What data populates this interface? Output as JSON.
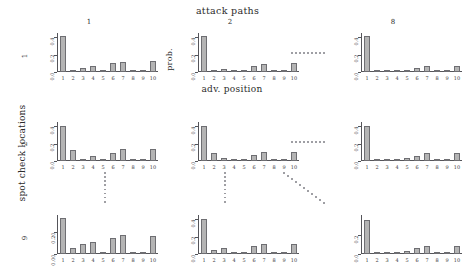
{
  "figure": {
    "top_title": "attack paths",
    "left_title": "spot check locations",
    "x_axis_label": "adv. position",
    "y_axis_label": "prob.",
    "column_labels": [
      "1",
      "2",
      "8"
    ],
    "row_labels": [
      "1",
      "2",
      "9"
    ],
    "bar_fill_color": "#b4b4b4",
    "bar_border_color": "#6e6e72",
    "axis_color": "#55555a",
    "background_color": "#ffffff"
  },
  "chart_data": {
    "type": "bar",
    "title": "attack paths",
    "xlabel": "adv. position",
    "ylabel": "prob.",
    "grid": false,
    "legend": "none",
    "layout": {
      "rows": 3,
      "cols": 3,
      "row_variable": "spot check locations",
      "col_variable": "attack paths",
      "row_levels": [
        "1",
        "2",
        "9"
      ],
      "col_levels": [
        "1",
        "2",
        "8"
      ],
      "row_gap_indicator": "vertical dotted ellipsis",
      "col_gap_indicator": "horizontal dotted ellipsis",
      "corner_gap_indicator": "diagonal dotted ellipsis"
    },
    "categories": [
      "1",
      "2",
      "3",
      "4",
      "5",
      "6",
      "7",
      "8",
      "9",
      "10"
    ],
    "panels": [
      {
        "row": "1",
        "col": "1",
        "ylim": [
          0.0,
          0.45
        ],
        "yticks": [
          0.0,
          0.2,
          0.4
        ],
        "ytick_labels": [
          "0.0",
          "0.2",
          "0.4"
        ],
        "values": [
          0.41,
          0.02,
          0.05,
          0.07,
          0.005,
          0.1,
          0.12,
          0.004,
          0.004,
          0.13
        ]
      },
      {
        "row": "1",
        "col": "2",
        "ylim": [
          0.0,
          0.45
        ],
        "yticks": [
          0.0,
          0.2,
          0.4
        ],
        "ytick_labels": [
          "0.0",
          "0.2",
          "0.4"
        ],
        "values": [
          0.42,
          0.02,
          0.04,
          0.005,
          0.005,
          0.07,
          0.09,
          0.004,
          0.004,
          0.1
        ]
      },
      {
        "row": "1",
        "col": "8",
        "ylim": [
          0.0,
          0.45
        ],
        "yticks": [
          0.0,
          0.2,
          0.4
        ],
        "ytick_labels": [
          "0.0",
          "0.2",
          "0.4"
        ],
        "values": [
          0.41,
          0.005,
          0.004,
          0.004,
          0.01,
          0.05,
          0.07,
          0.004,
          0.004,
          0.07
        ]
      },
      {
        "row": "2",
        "col": "1",
        "ylim": [
          0.0,
          0.45
        ],
        "yticks": [
          0.0,
          0.2,
          0.4
        ],
        "ytick_labels": [
          "0.0",
          "0.2",
          "0.4"
        ],
        "values": [
          0.4,
          0.13,
          0.02,
          0.06,
          0.005,
          0.09,
          0.14,
          0.004,
          0.004,
          0.14
        ]
      },
      {
        "row": "2",
        "col": "2",
        "ylim": [
          0.0,
          0.45
        ],
        "yticks": [
          0.0,
          0.2,
          0.4
        ],
        "ytick_labels": [
          "0.0",
          "0.2",
          "0.4"
        ],
        "values": [
          0.4,
          0.09,
          0.03,
          0.006,
          0.006,
          0.07,
          0.1,
          0.004,
          0.004,
          0.1
        ]
      },
      {
        "row": "2",
        "col": "8",
        "ylim": [
          0.0,
          0.45
        ],
        "yticks": [
          0.0,
          0.2,
          0.4
        ],
        "ytick_labels": [
          "0.0",
          "0.2",
          "0.4"
        ],
        "values": [
          0.4,
          0.005,
          0.004,
          0.004,
          0.03,
          0.06,
          0.09,
          0.004,
          0.004,
          0.09
        ]
      },
      {
        "row": "9",
        "col": "1",
        "ylim": [
          0.0,
          0.36
        ],
        "yticks": [
          0.0,
          0.2
        ],
        "ytick_labels": [
          "0.00",
          "0.20"
        ],
        "values": [
          0.33,
          0.06,
          0.09,
          0.11,
          0.006,
          0.15,
          0.18,
          0.005,
          0.005,
          0.17
        ]
      },
      {
        "row": "9",
        "col": "2",
        "ylim": [
          0.0,
          0.45
        ],
        "yticks": [
          0.0,
          0.2,
          0.4
        ],
        "ytick_labels": [
          "0.0",
          "0.2",
          "0.4"
        ],
        "values": [
          0.4,
          0.05,
          0.07,
          0.006,
          0.006,
          0.09,
          0.12,
          0.004,
          0.004,
          0.11
        ]
      },
      {
        "row": "9",
        "col": "8",
        "ylim": [
          0.0,
          0.42
        ],
        "yticks": [
          0.0,
          0.2
        ],
        "ytick_labels": [
          "0.0",
          "0.2"
        ],
        "values": [
          0.37,
          0.005,
          0.004,
          0.004,
          0.03,
          0.06,
          0.09,
          0.005,
          0.005,
          0.09
        ]
      }
    ]
  }
}
